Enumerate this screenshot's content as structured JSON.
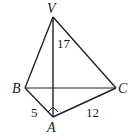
{
  "diagram": {
    "type": "tetrahedron",
    "vertices": {
      "V": {
        "label": "V",
        "x": 53,
        "y": 17
      },
      "B": {
        "label": "B",
        "x": 25,
        "y": 88
      },
      "C": {
        "label": "C",
        "x": 116,
        "y": 88
      },
      "A": {
        "label": "A",
        "x": 53,
        "y": 117
      }
    },
    "edges": [
      {
        "from": "V",
        "to": "B"
      },
      {
        "from": "V",
        "to": "C"
      },
      {
        "from": "V",
        "to": "A"
      },
      {
        "from": "B",
        "to": "C"
      },
      {
        "from": "B",
        "to": "A"
      },
      {
        "from": "A",
        "to": "C"
      }
    ],
    "measurements": {
      "VA": "17",
      "AB": "5",
      "AC": "12"
    },
    "right_angle_at": "A",
    "line_color": "#222222"
  }
}
